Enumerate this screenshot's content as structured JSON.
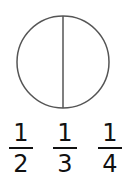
{
  "diagram": {
    "shape": "circle",
    "divisions": 2,
    "stroke_color": "#555555"
  },
  "options": [
    {
      "numerator": "1",
      "denominator": "2"
    },
    {
      "numerator": "1",
      "denominator": "3"
    },
    {
      "numerator": "1",
      "denominator": "4"
    }
  ]
}
